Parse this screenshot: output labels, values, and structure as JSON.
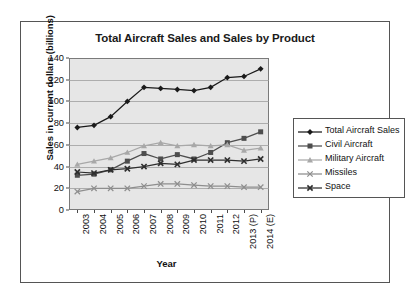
{
  "chart_data": {
    "type": "line",
    "title": "Total Aircraft Sales and Sales by Product",
    "xlabel": "Year",
    "ylabel": "Sales in current dollars (billions)",
    "categories": [
      "2003",
      "2004",
      "2005",
      "2006",
      "2007",
      "2008",
      "2009",
      "2010",
      "2011",
      "2012",
      "2013 (P)",
      "2014 (E)"
    ],
    "ylim": [
      0,
      140
    ],
    "yticks": [
      0,
      20,
      40,
      60,
      80,
      100,
      120,
      140
    ],
    "grid": true,
    "legend_position": "right",
    "series": [
      {
        "name": "Total Aircraft Sales",
        "marker": "diamond",
        "color": "#1a1a1a",
        "values": [
          76,
          78,
          86,
          100,
          113,
          112,
          111,
          110,
          113,
          122,
          123,
          130
        ]
      },
      {
        "name": "Civil Aircraft",
        "marker": "square",
        "color": "#4d4d4d",
        "values": [
          32,
          33,
          37,
          45,
          52,
          47,
          51,
          47,
          53,
          62,
          66,
          72
        ]
      },
      {
        "name": "Military Aircraft",
        "marker": "triangle",
        "color": "#a8a8a8",
        "values": [
          42,
          45,
          48,
          53,
          59,
          62,
          59,
          60,
          59,
          60,
          55,
          57
        ]
      },
      {
        "name": "Missiles",
        "marker": "cross",
        "color": "#8e8e8e",
        "values": [
          17,
          20,
          20,
          20,
          22,
          24,
          24,
          23,
          22,
          22,
          21,
          21
        ]
      },
      {
        "name": "Space",
        "marker": "cross-square",
        "color": "#2e2e2e",
        "values": [
          35,
          34,
          37,
          38,
          40,
          43,
          42,
          46,
          46,
          46,
          45,
          47
        ]
      }
    ]
  },
  "colors": {
    "plot_background": "#e6e6e6",
    "page_background": "#ffffff",
    "frame_border": "#555555",
    "gridline": "#9a9a9a"
  }
}
